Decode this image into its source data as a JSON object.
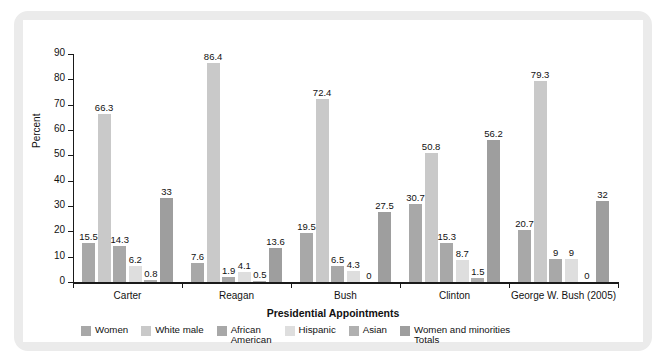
{
  "chart_data": {
    "type": "bar",
    "title": "",
    "xlabel": "Presidential Appointments",
    "ylabel": "Percent",
    "ylim": [
      0,
      90
    ],
    "ytick_labels": [
      "0",
      "10",
      "20",
      "30",
      "40",
      "50",
      "60",
      "70",
      "80",
      "90"
    ],
    "ytick_values": [
      0,
      10,
      20,
      30,
      40,
      50,
      60,
      70,
      80,
      90
    ],
    "grid": false,
    "legend_position": "bottom-left",
    "categories": [
      "Carter",
      "Reagan",
      "Bush",
      "Clinton",
      "George W. Bush (2005)"
    ],
    "series": [
      {
        "name": "Women",
        "color": "#a8a8a8",
        "values": [
          15.5,
          7.6,
          19.5,
          30.7,
          20.7
        ],
        "labels": [
          "15.5",
          "7.6",
          "19.5",
          "30.7",
          "20.7"
        ]
      },
      {
        "name": "White male",
        "color": "#c9c9c9",
        "values": [
          66.3,
          86.4,
          72.4,
          50.8,
          79.3
        ],
        "labels": [
          "66.3",
          "86.4",
          "72.4",
          "50.8",
          "79.3"
        ]
      },
      {
        "name": "African\nAmerican",
        "color": "#a8a8a8",
        "values": [
          14.3,
          1.9,
          6.5,
          15.3,
          9
        ],
        "labels": [
          "14.3",
          "1.9",
          "6.5",
          "15.3",
          "9"
        ]
      },
      {
        "name": "Hispanic",
        "color": "#dedede",
        "values": [
          6.2,
          4.1,
          4.3,
          8.7,
          9
        ],
        "labels": [
          "6.2",
          "4.1",
          "4.3",
          "8.7",
          "9"
        ]
      },
      {
        "name": "Asian",
        "color": "#b0b0b0",
        "values": [
          0.8,
          0.5,
          0,
          1.5,
          0
        ],
        "labels": [
          "0.8",
          "0.5",
          "0",
          "1.5",
          "0"
        ]
      },
      {
        "name": "Women and minorities\nTotals",
        "color": "#9e9e9e",
        "values": [
          33,
          13.6,
          27.5,
          56.2,
          32
        ],
        "labels": [
          "33",
          "13.6",
          "27.5",
          "56.2",
          "32"
        ]
      }
    ]
  },
  "frame": {
    "border_color": "#ebebeb",
    "background": "#ffffff"
  }
}
